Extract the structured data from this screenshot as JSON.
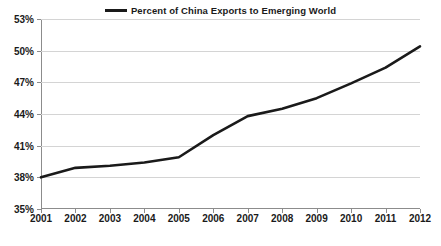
{
  "legend": {
    "position": "top-center",
    "entries": [
      {
        "label": "Percent of China Exports to Emerging World",
        "color": "#1a1a1a",
        "marker": "line-swatch"
      }
    ]
  },
  "colors": {
    "series": "#1a1a1a",
    "gridline": "#d4d4d4",
    "axis": "#8c8c8c",
    "text": "#1a1a1a",
    "background": "#ffffff"
  },
  "chart_data": {
    "type": "line",
    "title": "",
    "subtitle": "",
    "xlabel": "",
    "ylabel": "",
    "grid": true,
    "legend_position": "top-center",
    "x": [
      "2001",
      "2002",
      "2003",
      "2004",
      "2005",
      "2006",
      "2007",
      "2008",
      "2009",
      "2010",
      "2011",
      "2012"
    ],
    "categories": [
      "2001",
      "2002",
      "2003",
      "2004",
      "2005",
      "2006",
      "2007",
      "2008",
      "2009",
      "2010",
      "2011",
      "2012"
    ],
    "ylim": [
      35,
      53
    ],
    "ytick_values": [
      35,
      38,
      41,
      44,
      47,
      50,
      53
    ],
    "ytick_labels": [
      "35%",
      "38%",
      "41%",
      "44%",
      "47%",
      "50%",
      "53%"
    ],
    "xtick_labels": [
      "2001",
      "2002",
      "2003",
      "2004",
      "2005",
      "2006",
      "2007",
      "2008",
      "2009",
      "2010",
      "2011",
      "2012"
    ],
    "series": [
      {
        "name": "Percent of China Exports to Emerging World",
        "color": "#1a1a1a",
        "values": [
          38.0,
          38.9,
          39.1,
          39.4,
          39.9,
          42.0,
          43.8,
          44.5,
          45.5,
          46.9,
          48.4,
          50.4
        ]
      }
    ]
  },
  "source_note": ""
}
